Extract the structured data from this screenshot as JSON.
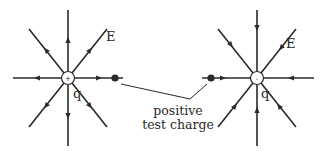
{
  "diagram": {
    "colors": {
      "ink": "#2a2a2a",
      "background": "#ffffff"
    },
    "left_charge": {
      "sign_symbol": "+",
      "charge_label": "q",
      "field_label": "E",
      "field_direction": "outward",
      "line_count": 8
    },
    "right_charge": {
      "sign_symbol": "-",
      "charge_label": "q",
      "field_label": "E",
      "field_direction": "inward",
      "line_count": 8
    },
    "test_charge": {
      "label_line1": "positive",
      "label_line2": "test charge"
    }
  }
}
